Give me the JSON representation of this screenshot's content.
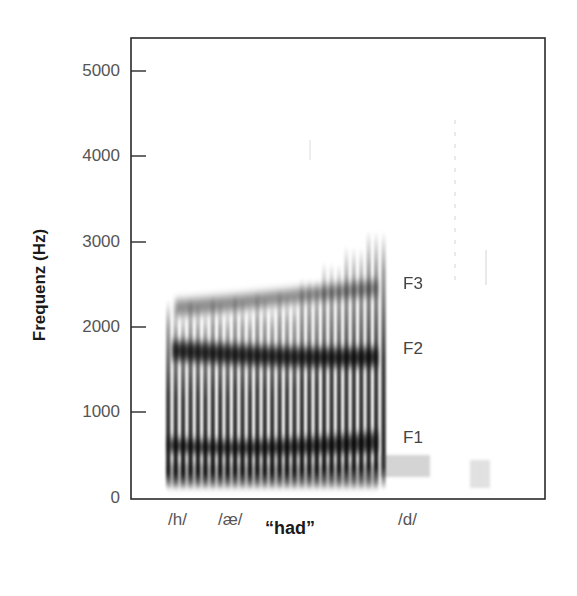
{
  "chart_data": {
    "type": "heatmap",
    "subtype": "spectrogram",
    "title": "",
    "xlabel": "“had”",
    "ylabel": "Frequenz (Hz)",
    "ylim": [
      0,
      5200
    ],
    "y_ticks": [
      0,
      1000,
      2000,
      3000,
      4000,
      5000
    ],
    "y_tick_labels": [
      "0",
      "1000",
      "2000",
      "3000",
      "4000",
      "5000"
    ],
    "x_segments": [
      {
        "label": "/h/",
        "position": 0.12
      },
      {
        "label": "/æ/",
        "position": 0.23
      },
      {
        "label": "/d/",
        "position": 0.68
      }
    ],
    "formants": [
      {
        "label": "F1",
        "start_hz": 600,
        "end_hz": 700,
        "label_hz": 750
      },
      {
        "label": "F2",
        "start_hz": 1750,
        "end_hz": 1700,
        "label_hz": 1770
      },
      {
        "label": "F3",
        "start_hz": 2300,
        "end_hz": 2500,
        "label_hz": 2520
      }
    ],
    "voicing": {
      "start_fraction": 0.09,
      "end_fraction": 0.61,
      "pulse_count": 30
    },
    "grid": false,
    "colormap": "grayscale (dark = high energy)"
  },
  "labels": {
    "ylabel": "Frequenz (Hz)",
    "xlabel": "“had”",
    "ticks": [
      "5000",
      "4000",
      "3000",
      "2000",
      "1000",
      "0"
    ],
    "segments": [
      "/h/",
      "/æ/",
      "/d/"
    ],
    "formants": [
      "F3",
      "F2",
      "F1"
    ]
  }
}
